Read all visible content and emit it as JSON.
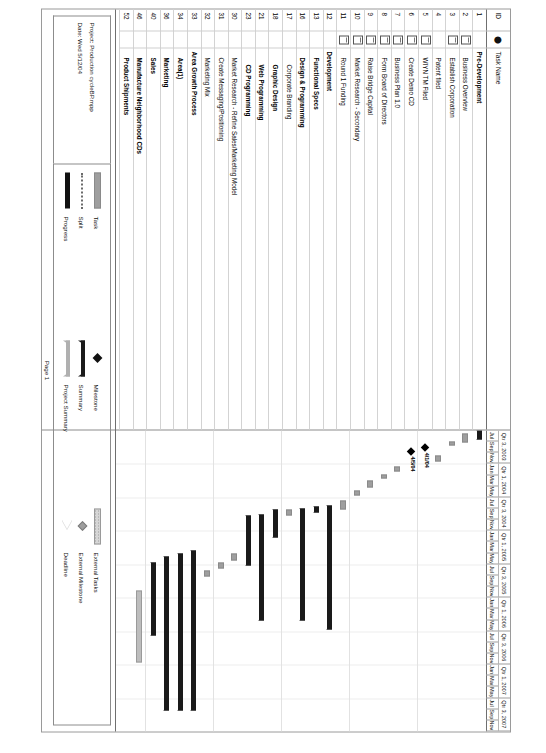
{
  "document": {
    "page_label": "Page 1",
    "project_line": "Project: Production cycleBP.mpp",
    "date_line": "Date: Wed 5/12/04"
  },
  "table": {
    "headers": {
      "id": "ID",
      "indicator": "⬤",
      "name": "Task Name"
    },
    "rows": [
      {
        "id": "1",
        "indicator": "",
        "name": "Pre-Development",
        "style": "summary",
        "indent": 0
      },
      {
        "id": "2",
        "indicator": "note",
        "name": "Business Overview",
        "style": "task",
        "indent": 1
      },
      {
        "id": "3",
        "indicator": "note",
        "name": "Establish Corporation",
        "style": "task",
        "indent": 1
      },
      {
        "id": "4",
        "indicator": "",
        "name": "Patent filed",
        "style": "task",
        "indent": 1
      },
      {
        "id": "5",
        "indicator": "note",
        "name": "WIYN TM Filed",
        "style": "task",
        "indent": 1
      },
      {
        "id": "6",
        "indicator": "note",
        "name": "Create Demo CD",
        "style": "task",
        "indent": 1
      },
      {
        "id": "7",
        "indicator": "note",
        "name": "Business Plan 1.0",
        "style": "task",
        "indent": 1
      },
      {
        "id": "8",
        "indicator": "note",
        "name": "Form Board of Directors",
        "style": "task",
        "indent": 1
      },
      {
        "id": "9",
        "indicator": "note",
        "name": "Raise Bridge Capital",
        "style": "task",
        "indent": 1
      },
      {
        "id": "10",
        "indicator": "note",
        "name": "Market Research - Secondary",
        "style": "task",
        "indent": 1
      },
      {
        "id": "11",
        "indicator": "note",
        "name": "Round 1 Funding",
        "style": "task",
        "indent": 1
      },
      {
        "id": "12",
        "indicator": "",
        "name": "Development",
        "style": "summary",
        "indent": 0
      },
      {
        "id": "13",
        "indicator": "",
        "name": "Functional Specs",
        "style": "summary",
        "indent": 1
      },
      {
        "id": "16",
        "indicator": "",
        "name": "Design & Programming",
        "style": "summary",
        "indent": 1
      },
      {
        "id": "17",
        "indicator": "",
        "name": "Corporate Branding",
        "style": "task",
        "indent": 2
      },
      {
        "id": "18",
        "indicator": "",
        "name": "Graphic Design",
        "style": "summary",
        "indent": 2
      },
      {
        "id": "21",
        "indicator": "",
        "name": "Web Programming",
        "style": "summary",
        "indent": 2
      },
      {
        "id": "23",
        "indicator": "",
        "name": "CD Programming",
        "style": "summary",
        "indent": 2
      },
      {
        "id": "30",
        "indicator": "",
        "name": "Market Research - Refine Sales/Marketing Model",
        "style": "task",
        "indent": 1
      },
      {
        "id": "31",
        "indicator": "",
        "name": "Create Messaging/Positioning",
        "style": "task",
        "indent": 1
      },
      {
        "id": "32",
        "indicator": "",
        "name": "Marketing Mix",
        "style": "task",
        "indent": 1
      },
      {
        "id": "33",
        "indicator": "",
        "name": "Area Growth Process",
        "style": "summary",
        "indent": 0
      },
      {
        "id": "34",
        "indicator": "",
        "name": "Area(1)",
        "style": "summary",
        "indent": 1
      },
      {
        "id": "36",
        "indicator": "",
        "name": "Marketing",
        "style": "summary",
        "indent": 1
      },
      {
        "id": "40",
        "indicator": "",
        "name": "Sales",
        "style": "summary",
        "indent": 1
      },
      {
        "id": "46",
        "indicator": "",
        "name": "Manufacture Neighborhood CDs",
        "style": "summary",
        "indent": 1
      },
      {
        "id": "52",
        "indicator": "",
        "name": "Product Shipments",
        "style": "summary",
        "indent": 1
      }
    ]
  },
  "chart_data": {
    "type": "bar",
    "xlabel": "",
    "ylabel": "",
    "timescale": {
      "quarters": [
        "Qtr 3, 2003",
        "Qtr 1, 2004",
        "Qtr 3, 2004",
        "Qtr 1, 2005",
        "Qtr 3, 2005",
        "Qtr 1, 2006",
        "Qtr 3, 2006",
        "Qtr 1, 2007",
        "Qtr 3, 2007"
      ],
      "months": [
        "Jul",
        "Sep",
        "Nov",
        "Jan",
        "Mar",
        "May",
        "Jul",
        "Sep",
        "Nov",
        "Jan",
        "Mar",
        "May",
        "Jul",
        "Sep",
        "Nov",
        "Jan",
        "Mar",
        "May",
        "Jul",
        "Sep",
        "Nov",
        "Jan",
        "Mar",
        "May",
        "Jul",
        "Sep",
        "Nov"
      ],
      "start": "Jul 2003",
      "end": "Nov 2007"
    },
    "bars": [
      {
        "row": 0,
        "kind": "summary",
        "start_pct": 0.0,
        "end_pct": 3.0,
        "label": ""
      },
      {
        "row": 1,
        "kind": "task",
        "start_pct": 1.0,
        "end_pct": 4.1,
        "label": ""
      },
      {
        "row": 2,
        "kind": "task",
        "start_pct": 3.7,
        "end_pct": 5.1,
        "label": ""
      },
      {
        "row": 3,
        "kind": "task",
        "start_pct": 8.2,
        "end_pct": 10.4,
        "label": ""
      },
      {
        "row": 4,
        "kind": "milestone",
        "start_pct": 5.7,
        "end_pct": 5.7,
        "label": "4/1/04"
      },
      {
        "row": 5,
        "kind": "milestone",
        "start_pct": 7.0,
        "end_pct": 7.0,
        "label": "4/5/04"
      },
      {
        "row": 6,
        "kind": "task",
        "start_pct": 12.0,
        "end_pct": 13.5,
        "label": ""
      },
      {
        "row": 7,
        "kind": "task",
        "start_pct": 14.6,
        "end_pct": 16.0,
        "label": ""
      },
      {
        "row": 8,
        "kind": "task",
        "start_pct": 16.6,
        "end_pct": 19.0,
        "label": ""
      },
      {
        "row": 9,
        "kind": "task",
        "start_pct": 19.8,
        "end_pct": 21.5,
        "label": ""
      },
      {
        "row": 10,
        "kind": "task",
        "start_pct": 23.4,
        "end_pct": 26.4,
        "label": ""
      },
      {
        "row": 11,
        "kind": "summary",
        "start_pct": 25.0,
        "end_pct": 66.0,
        "label": ""
      },
      {
        "row": 12,
        "kind": "summary",
        "start_pct": 25.3,
        "end_pct": 27.3,
        "label": ""
      },
      {
        "row": 13,
        "kind": "summary",
        "start_pct": 26.0,
        "end_pct": 63.0,
        "label": ""
      },
      {
        "row": 14,
        "kind": "task",
        "start_pct": 26.4,
        "end_pct": 28.2,
        "label": ""
      },
      {
        "row": 15,
        "kind": "summary",
        "start_pct": 26.4,
        "end_pct": 35.5,
        "label": ""
      },
      {
        "row": 16,
        "kind": "summary",
        "start_pct": 28.0,
        "end_pct": 63.0,
        "label": ""
      },
      {
        "row": 17,
        "kind": "summary",
        "start_pct": 28.4,
        "end_pct": 45.0,
        "label": ""
      },
      {
        "row": 18,
        "kind": "task",
        "start_pct": 41.0,
        "end_pct": 43.2,
        "label": ""
      },
      {
        "row": 19,
        "kind": "task",
        "start_pct": 44.0,
        "end_pct": 46.0,
        "label": ""
      },
      {
        "row": 20,
        "kind": "task",
        "start_pct": 46.6,
        "end_pct": 48.6,
        "label": ""
      },
      {
        "row": 21,
        "kind": "summary",
        "start_pct": 40.0,
        "end_pct": 93.0,
        "label": ""
      },
      {
        "row": 22,
        "kind": "summary",
        "start_pct": 41.0,
        "end_pct": 93.0,
        "label": ""
      },
      {
        "row": 23,
        "kind": "summary",
        "start_pct": 42.0,
        "end_pct": 93.0,
        "label": ""
      },
      {
        "row": 24,
        "kind": "summary",
        "start_pct": 44.0,
        "end_pct": 68.0,
        "label": ""
      },
      {
        "row": 25,
        "kind": "external",
        "start_pct": 53.0,
        "end_pct": 77.0,
        "label": ""
      },
      {
        "row": 26,
        "kind": "none",
        "start_pct": 0.0,
        "end_pct": 0.0,
        "label": ""
      }
    ],
    "grid": true,
    "legend_position": "bottom"
  },
  "legend": {
    "columns": [
      {
        "items": [
          {
            "label": "Task",
            "swatch": "sw-task"
          },
          {
            "label": "Split",
            "swatch": "sw-split"
          },
          {
            "label": "Progress",
            "swatch": "sw-prog"
          }
        ]
      },
      {
        "items": [
          {
            "label": "Milestone",
            "swatch": "sw-ms"
          },
          {
            "label": "Summary",
            "swatch": "sw-sum"
          },
          {
            "label": "Project Summary",
            "swatch": "sw-psum"
          }
        ]
      },
      {
        "items": [
          {
            "label": "External Tasks",
            "swatch": "sw-ext"
          },
          {
            "label": "External Milestone",
            "swatch": "sw-extms"
          },
          {
            "label": "Deadline",
            "swatch": "sw-dead"
          }
        ]
      }
    ]
  },
  "colors": {
    "task_fill": "#9e9e9e",
    "summary_fill": "#1a1a1a",
    "project_summary_fill": "#b0b0b0",
    "external_fill": "#d6d6d6",
    "milestone_fill": "#000000",
    "grid": "#e2e2e2",
    "border": "#8c8c8c",
    "page_bg": "#ffffff"
  }
}
